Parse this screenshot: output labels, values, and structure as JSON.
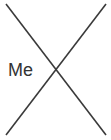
{
  "canvas": {
    "width": 111,
    "height": 140,
    "background_color": "#ffffff"
  },
  "diagram": {
    "type": "x-cross-mark",
    "stroke_color": "#3a3a3a",
    "stroke_width": 1.6,
    "strokes": [
      {
        "name": "diagonal-top-left-to-bottom-right",
        "x1": 6,
        "y1": 4,
        "x2": 106,
        "y2": 135
      },
      {
        "name": "diagonal-top-right-to-bottom-left",
        "x1": 106,
        "y1": 4,
        "x2": 6,
        "y2": 135
      }
    ],
    "intersection": {
      "x": 56,
      "y": 70
    }
  },
  "labels": {
    "me": {
      "text": "Me",
      "color": "#333333",
      "font_size": 18,
      "x": 9,
      "y": 64
    }
  }
}
